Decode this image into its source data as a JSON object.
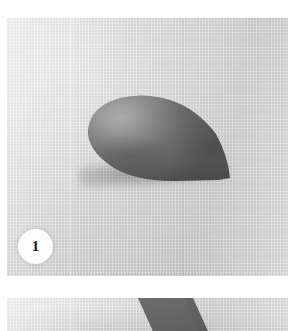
{
  "gallery": {
    "label": "Step-by-step photo instructions",
    "background_color": "#ffffff",
    "photos": [
      {
        "name": "photo-step-1",
        "caption_badge": "1",
        "alt": "Grey clay teardrop-shaped cone resting on light grey fabric",
        "fabric_color": "#d8d8d8",
        "clay_color": "#6e6e6e",
        "badge_color": "#fdfdfd",
        "badge_text_color": "#1b1b1b"
      },
      {
        "name": "photo-step-2",
        "caption_badge": "",
        "alt": "Top edge of next photo showing a dark grey clay band on light fabric",
        "fabric_color": "#dadada",
        "clay_color": "#6a6a6a"
      }
    ]
  }
}
